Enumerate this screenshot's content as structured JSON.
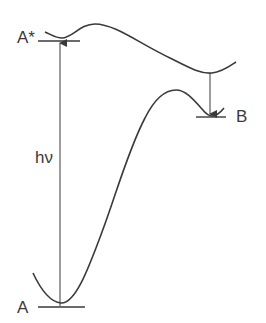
{
  "diagram": {
    "type": "potential-energy-diagram",
    "colors": {
      "line": "#3a3a3a",
      "background": "#ffffff"
    },
    "labels": {
      "excited_state": "A*",
      "photon": "hν",
      "product_state": "B",
      "ground_state": "A"
    },
    "elements": [
      {
        "id": "upper-curve",
        "description": "excited-state potential energy surface"
      },
      {
        "id": "lower-curve",
        "description": "ground-state potential energy surface"
      },
      {
        "id": "excitation-arrow",
        "description": "vertical absorption arrow from A to A*"
      },
      {
        "id": "decay-arrow",
        "description": "downward arrow from upper curve minimum to B"
      },
      {
        "id": "level-a-star",
        "description": "horizontal level line at A*"
      },
      {
        "id": "level-a",
        "description": "horizontal level line at A"
      },
      {
        "id": "level-b",
        "description": "horizontal level line at B"
      }
    ]
  }
}
